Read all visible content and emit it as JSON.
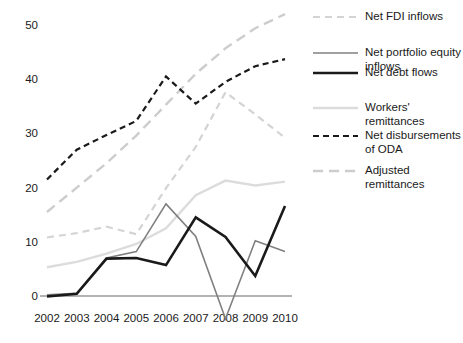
{
  "chart_data": {
    "type": "line",
    "title": "",
    "subtitle": "",
    "xlabel": "",
    "ylabel": "",
    "categories": [
      "2002",
      "2003",
      "2004",
      "2005",
      "2006",
      "2007",
      "2008",
      "2009",
      "2010"
    ],
    "x": [
      2002,
      2003,
      2004,
      2005,
      2006,
      2007,
      2008,
      2009,
      2010
    ],
    "ylim": [
      -5,
      53
    ],
    "yticks": [
      0,
      10,
      20,
      30,
      40,
      50
    ],
    "ytick_labels": [
      "0",
      "10",
      "20",
      "30",
      "40",
      "50"
    ],
    "grid": false,
    "legend_position": "right",
    "series": [
      {
        "name": "Net FDI inflows",
        "values": [
          10.8,
          11.6,
          12.8,
          11.4,
          19.9,
          27.5,
          37.6,
          33.5,
          29.2
        ],
        "color": "#d4d4d4",
        "style": "dashed",
        "dasharray": "7,5",
        "width": 2.2
      },
      {
        "name": "Net portfolio equity inflows",
        "values": [
          0.2,
          0.5,
          7.0,
          8.2,
          17.0,
          11.0,
          -4.2,
          10.2,
          8.2
        ],
        "color": "#808080",
        "style": "solid",
        "dasharray": "",
        "width": 1.6
      },
      {
        "name": "Net debt flows",
        "values": [
          -0.1,
          0.4,
          6.9,
          7.0,
          5.7,
          14.5,
          10.9,
          3.7,
          16.6
        ],
        "color": "#1a1a1a",
        "style": "solid",
        "dasharray": "",
        "width": 2.6
      },
      {
        "name": "Workers' remittances",
        "values": [
          5.3,
          6.3,
          7.8,
          9.6,
          12.5,
          18.6,
          21.3,
          20.4,
          21.1
        ],
        "color": "#dcdcdc",
        "style": "solid",
        "dasharray": "",
        "width": 2.4
      },
      {
        "name": "Net disbursements of ODA",
        "values": [
          21.5,
          27.0,
          29.7,
          32.3,
          40.5,
          35.5,
          39.5,
          42.4,
          43.7
        ],
        "color": "#1a1a1a",
        "style": "dashed",
        "dasharray": "6,4",
        "width": 2.2
      },
      {
        "name": "Adjusted remittances",
        "values": [
          15.5,
          20.0,
          24.5,
          29.6,
          35.3,
          41.0,
          45.7,
          49.4,
          52.0
        ],
        "color": "#cdcdcd",
        "style": "dashed",
        "dasharray": "10,6",
        "width": 2.4
      }
    ],
    "axis_color": "#9a9a9a"
  },
  "legend": {
    "items": [
      {
        "label": "Net FDI inflows"
      },
      {
        "label": "Net portfolio equity inflows"
      },
      {
        "label": "Net debt flows"
      },
      {
        "label": "Workers' remittances"
      },
      {
        "label": "Net disbursements of ODA"
      },
      {
        "label": "Adjusted remittances"
      }
    ]
  }
}
